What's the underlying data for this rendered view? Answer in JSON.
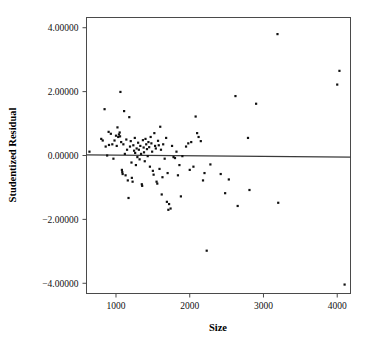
{
  "chart_data": {
    "type": "scatter",
    "title": "",
    "xlabel": "Size",
    "ylabel": "Studentized Residual",
    "xlim": [
      600,
      4180
    ],
    "ylim": [
      -4.32,
      4.32
    ],
    "grid": false,
    "legend": null,
    "xticks": [
      1000,
      2000,
      3000,
      4000
    ],
    "xtick_labels": [
      "1000",
      "2000",
      "3000",
      "4000"
    ],
    "yticks": [
      4,
      2,
      0,
      -2,
      -4
    ],
    "ytick_labels": [
      "4.00000",
      "2.00000",
      "0.00000",
      "−2.00000",
      "−4.00000"
    ],
    "reference_line": {
      "type": "horizontal-fit",
      "x_start": 600,
      "y_start": 0.02,
      "x_end": 4180,
      "y_end": -0.05
    },
    "marker": {
      "shape": "square",
      "size": 2.2,
      "color": "#111111"
    },
    "series": [
      {
        "name": "Studentized Residual vs Size",
        "points": [
          [
            640,
            0.12
          ],
          [
            800,
            0.52
          ],
          [
            820,
            0.47
          ],
          [
            845,
            1.45
          ],
          [
            860,
            0.28
          ],
          [
            880,
            0.0
          ],
          [
            900,
            0.74
          ],
          [
            905,
            0.33
          ],
          [
            930,
            0.68
          ],
          [
            950,
            0.35
          ],
          [
            965,
            -0.1
          ],
          [
            980,
            0.47
          ],
          [
            1000,
            0.62
          ],
          [
            1010,
            0.3
          ],
          [
            1020,
            0.88
          ],
          [
            1030,
            0.58
          ],
          [
            1040,
            0.66
          ],
          [
            1050,
            0.72
          ],
          [
            1055,
            0.6
          ],
          [
            1060,
            1.99
          ],
          [
            1070,
            0.42
          ],
          [
            1080,
            -0.45
          ],
          [
            1085,
            -0.52
          ],
          [
            1090,
            -0.58
          ],
          [
            1100,
            0.35
          ],
          [
            1110,
            1.39
          ],
          [
            1120,
            0.05
          ],
          [
            1130,
            -0.62
          ],
          [
            1140,
            0.5
          ],
          [
            1150,
            0.18
          ],
          [
            1160,
            -0.78
          ],
          [
            1170,
            -1.33
          ],
          [
            1180,
            1.2
          ],
          [
            1190,
            0.28
          ],
          [
            1200,
            0.45
          ],
          [
            1210,
            -0.22
          ],
          [
            1215,
            -0.7
          ],
          [
            1225,
            -0.82
          ],
          [
            1235,
            0.32
          ],
          [
            1245,
            0.15
          ],
          [
            1255,
            0.55
          ],
          [
            1260,
            0.08
          ],
          [
            1270,
            -0.3
          ],
          [
            1280,
            0.22
          ],
          [
            1290,
            -0.05
          ],
          [
            1300,
            0.4
          ],
          [
            1310,
            0.18
          ],
          [
            1320,
            -0.12
          ],
          [
            1330,
            0.3
          ],
          [
            1340,
            0.05
          ],
          [
            1350,
            -0.9
          ],
          [
            1355,
            -0.95
          ],
          [
            1365,
            0.48
          ],
          [
            1375,
            0.25
          ],
          [
            1380,
            0.1
          ],
          [
            1390,
            -0.18
          ],
          [
            1400,
            0.52
          ],
          [
            1410,
            0.35
          ],
          [
            1420,
            0.2
          ],
          [
            1430,
            -0.02
          ],
          [
            1440,
            0.42
          ],
          [
            1450,
            0.26
          ],
          [
            1460,
            -0.35
          ],
          [
            1470,
            0.58
          ],
          [
            1480,
            0.38
          ],
          [
            1490,
            0.12
          ],
          [
            1500,
            -0.48
          ],
          [
            1510,
            -0.6
          ],
          [
            1520,
            0.7
          ],
          [
            1530,
            0.3
          ],
          [
            1540,
            0.22
          ],
          [
            1550,
            -0.82
          ],
          [
            1560,
            -0.88
          ],
          [
            1570,
            0.46
          ],
          [
            1580,
            0.32
          ],
          [
            1590,
            -0.42
          ],
          [
            1600,
            0.9
          ],
          [
            1610,
            0.18
          ],
          [
            1620,
            -1.22
          ],
          [
            1630,
            -0.68
          ],
          [
            1640,
            0.35
          ],
          [
            1660,
            -0.1
          ],
          [
            1680,
            0.55
          ],
          [
            1690,
            -1.45
          ],
          [
            1700,
            -0.55
          ],
          [
            1710,
            -1.7
          ],
          [
            1720,
            -1.52
          ],
          [
            1740,
            -1.66
          ],
          [
            1760,
            0.3
          ],
          [
            1780,
            -0.05
          ],
          [
            1800,
            -0.08
          ],
          [
            1820,
            0.12
          ],
          [
            1840,
            -0.62
          ],
          [
            1860,
            -0.3
          ],
          [
            1880,
            -1.28
          ],
          [
            1900,
            -0.02
          ],
          [
            1950,
            0.28
          ],
          [
            1980,
            0.38
          ],
          [
            2000,
            -0.45
          ],
          [
            2020,
            0.42
          ],
          [
            2050,
            -0.35
          ],
          [
            2080,
            1.22
          ],
          [
            2100,
            0.7
          ],
          [
            2120,
            0.58
          ],
          [
            2150,
            0.45
          ],
          [
            2180,
            -0.78
          ],
          [
            2200,
            -0.55
          ],
          [
            2230,
            -2.98
          ],
          [
            2280,
            -0.28
          ],
          [
            2420,
            -0.58
          ],
          [
            2480,
            -1.18
          ],
          [
            2530,
            -0.75
          ],
          [
            2620,
            1.86
          ],
          [
            2650,
            -1.58
          ],
          [
            2790,
            0.55
          ],
          [
            2810,
            -1.08
          ],
          [
            2900,
            1.62
          ],
          [
            3190,
            3.8
          ],
          [
            3200,
            -1.48
          ],
          [
            4000,
            2.22
          ],
          [
            4030,
            2.65
          ],
          [
            4100,
            -4.04
          ]
        ]
      }
    ]
  },
  "axes": {
    "x_axis_name": "size-axis",
    "y_axis_name": "studentized-residual-axis"
  }
}
